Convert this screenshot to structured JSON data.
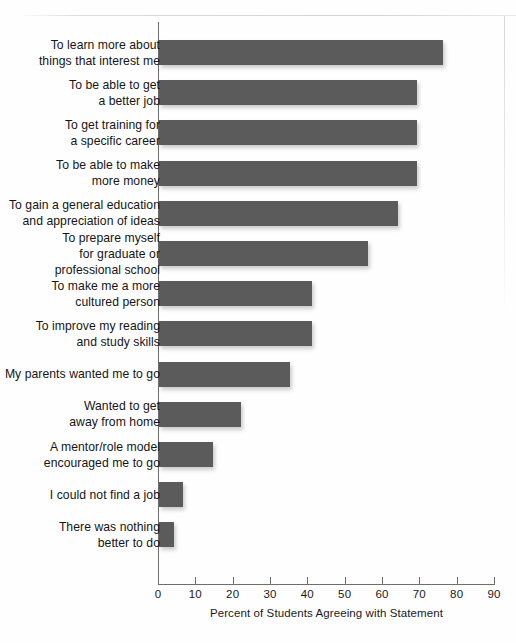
{
  "chart_data": {
    "type": "bar",
    "orientation": "horizontal",
    "title": "",
    "xlabel": "Percent of Students Agreeing with Statement",
    "ylabel": "",
    "xlim": [
      0,
      90
    ],
    "xticks": [
      0,
      10,
      20,
      30,
      40,
      50,
      60,
      70,
      80,
      90
    ],
    "xtick_labels": [
      "0",
      "10",
      "20",
      "30",
      "40",
      "50",
      "60",
      "70",
      "80",
      "90"
    ],
    "grid": false,
    "legend": null,
    "bar_color": "#5b5b5b",
    "axis_color": "#6e6e6e",
    "categories": [
      "To learn more about\nthings that interest me",
      "To be able to get\na better job",
      "To get training for\na specific career",
      "To be able to make\nmore money",
      "To gain a general education\nand appreciation of ideas",
      "To prepare myself\nfor graduate or\nprofessional school",
      "To make me a more\ncultured person",
      "To improve my reading\nand study skills",
      "My parents wanted me to go",
      "Wanted to get\naway from home",
      "A mentor/role model\nencouraged me to go",
      "I could not find a job",
      "There was nothing\nbetter to do"
    ],
    "values": [
      76,
      69,
      69,
      69,
      64,
      56,
      41,
      41,
      35,
      22,
      14.5,
      6.5,
      4
    ]
  }
}
